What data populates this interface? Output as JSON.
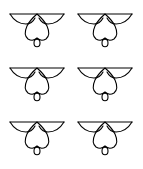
{
  "figure": {
    "grid": {
      "rows": 3,
      "cols": 2
    },
    "stroke_color": "#000000",
    "background": "#ffffff",
    "shapes": [
      {
        "name": "flower-motif",
        "row": 0,
        "col": 0,
        "x": 8,
        "y": 11
      },
      {
        "name": "flower-motif",
        "row": 0,
        "col": 1,
        "x": 76,
        "y": 11
      },
      {
        "name": "flower-motif",
        "row": 1,
        "col": 0,
        "x": 8,
        "y": 65
      },
      {
        "name": "flower-motif",
        "row": 1,
        "col": 1,
        "x": 76,
        "y": 65
      },
      {
        "name": "flower-motif",
        "row": 2,
        "col": 0,
        "x": 8,
        "y": 119
      },
      {
        "name": "flower-motif",
        "row": 2,
        "col": 1,
        "x": 76,
        "y": 119
      }
    ]
  }
}
